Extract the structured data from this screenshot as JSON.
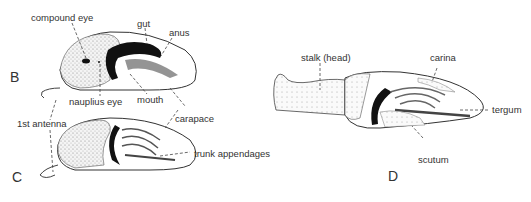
{
  "diagram": {
    "panels": [
      {
        "id": "B",
        "label": "B",
        "stage": "cypris larva (side view)"
      },
      {
        "id": "C",
        "label": "C",
        "stage": "cypris larva (settled)"
      },
      {
        "id": "D",
        "label": "D",
        "stage": "young barnacle with stalk"
      }
    ],
    "labels": {
      "compound_eye": "compound eye",
      "gut": "gut",
      "anus": "anus",
      "nauplius_eye": "nauplius eye",
      "mouth": "mouth",
      "first_antenna": "1st antenna",
      "carapace": "carapace",
      "trunk_appendages": "trunk appendages",
      "stalk_head": "stalk (head)",
      "carina": "carina",
      "tergum": "tergum",
      "scutum": "scutum"
    }
  }
}
